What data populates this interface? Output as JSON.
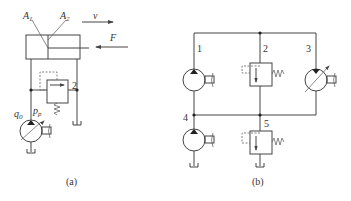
{
  "figure": {
    "panel_a": {
      "caption": "(a)",
      "labels": {
        "area1": "A1",
        "area1_main": "A",
        "area1_sub": "1",
        "area2_main": "A",
        "area2_sub": "2",
        "velocity": "v",
        "force": "F",
        "flow_main": "q",
        "flow_sub": "p",
        "pressure_main": "p",
        "pressure_sub": "p",
        "valve_number": "2"
      },
      "components": [
        "hydraulic-cylinder",
        "relief-valve",
        "fixed-displacement-pump",
        "tank"
      ]
    },
    "panel_b": {
      "caption": "(b)",
      "labels": {
        "n1": "1",
        "n2": "2",
        "n3": "3",
        "n4": "4",
        "n5": "5"
      },
      "components": [
        "pump-1",
        "relief-valve-2",
        "variable-motor-3",
        "pump-4",
        "relief-valve-5"
      ]
    }
  }
}
